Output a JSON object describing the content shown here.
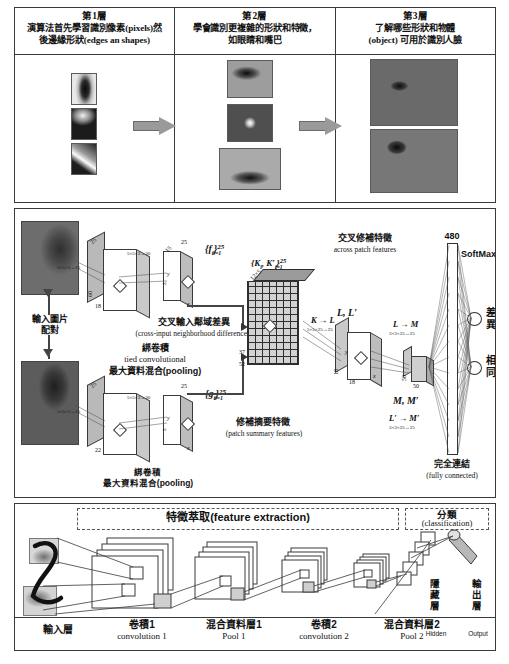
{
  "panel1": {
    "columns": [
      {
        "title": "第1層",
        "desc_line1": "演算法首先學習識別像素(pixels)然",
        "desc_line2": "後邊緣形狀(edges an shapes)"
      },
      {
        "title": "第2層",
        "desc_line1": "學會識別更複雜的形狀和特徵，",
        "desc_line2": "如眼睛和嘴巴"
      },
      {
        "title": "第3層",
        "desc_line1": "了解哪些形狀和物體",
        "desc_line2": "(object) 可用於識別人臉"
      }
    ],
    "arrow_icon": "block-arrow-right"
  },
  "panel2": {
    "input_label_cn": "輸入圖片",
    "input_label_cn2": "配對",
    "tied_conv_cn": "綁卷積",
    "tied_conv_en": "tied convolutional",
    "pooling_cn": "最大資料混合(pooling)",
    "tied_conv_cn_b": "綁卷積",
    "pooling_cn_b": "最大資料混合(pooling)",
    "cross_input_cn": "交叉輸入鄰域差異",
    "cross_input_en": "(cross-input neighborhood differences)",
    "patch_summary_cn": "修補摘要特徵",
    "patch_summary_en": "(patch summary features)",
    "across_patch_cn": "交叉修補特徵",
    "across_patch_en": "across patch features",
    "fully_connected_cn": "完全連結",
    "fully_connected_en": "(fully connected)",
    "softmax": "SoftMax",
    "out1_cn": "差異",
    "out2_cn": "相同",
    "fc_size": "480",
    "f_set": "{f",
    "f_sub": "i",
    "f_sup": "25",
    "f_sub2": "i = 1",
    "g_set": "{g",
    "k_set": "{K",
    "l_set": "L, L′",
    "m_set": "M, M′",
    "map_k_l": "K → L",
    "map_k_l_dims": "5×5×25→25",
    "map_l_m": "L → M",
    "map_l_m_dims": "3×3×25→25",
    "map_l_m2": "L′ → M′",
    "map_l_m2_dims": "3×3×25→25",
    "conv1_dims": "5×5×3→15",
    "conv2_dims": "5×5×3→30",
    "conv1b_dims": "5×5×3→15",
    "conv2b_dims": "5×5×3→30",
    "n_25_top": "25",
    "n_25_bot": "25",
    "n_18_top": "18",
    "n_22_bot": "22",
    "n_37": "37",
    "n_52": "52",
    "n_12x5": "12×5",
    "n_18_mid": "18",
    "n_50": "50",
    "n_60": "60",
    "axis_x": "x",
    "axis_y": "y",
    "axis_z": "z"
  },
  "panel3": {
    "feature_extraction_cn": "特徵萃取(feature extraction)",
    "classification_cn": "分類",
    "classification_en": "(classification)",
    "stages": [
      {
        "cn": "輸入層",
        "en": ""
      },
      {
        "cn": "卷積1",
        "en": "convolution 1"
      },
      {
        "cn": "混合資料層1",
        "en": "Pool 1"
      },
      {
        "cn": "卷積2",
        "en": "convolution 2"
      },
      {
        "cn": "混合資料層2",
        "en": "Pool 2"
      }
    ],
    "hidden_cn": [
      "隱",
      "藏",
      "層"
    ],
    "hidden_en": "Hidden",
    "output_cn": [
      "輸",
      "出",
      "層"
    ],
    "output_en": "Output"
  },
  "colors": {
    "border": "#3a3a3a",
    "arrow_fill": "#9a9a9a",
    "block_side": "#b9b9b9",
    "grid": "#2e2e2e"
  }
}
